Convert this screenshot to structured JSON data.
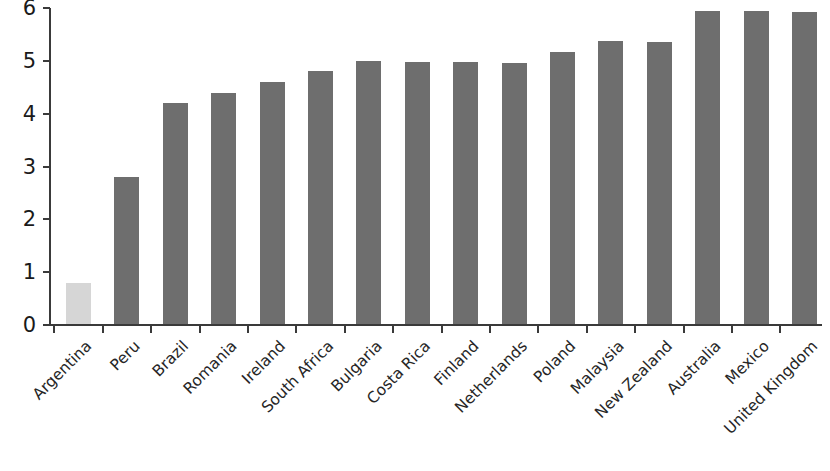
{
  "chart_data": {
    "type": "bar",
    "title": "",
    "subtitle": "",
    "xlabel": "",
    "ylabel": "",
    "categories": [
      "Argentina",
      "Peru",
      "Brazil",
      "Romania",
      "Ireland",
      "South Africa",
      "Bulgaria",
      "Costa Rica",
      "Finland",
      "Netherlands",
      "Poland",
      "Malaysia",
      "New Zealand",
      "Australia",
      "Mexico",
      "United Kingdom"
    ],
    "values": [
      0.8,
      2.8,
      4.2,
      4.4,
      4.6,
      4.8,
      5.0,
      4.98,
      4.97,
      4.96,
      5.17,
      5.37,
      5.35,
      5.95,
      5.95,
      5.93
    ],
    "bar_colors": [
      "#d6d6d6",
      "#6e6e6e",
      "#6e6e6e",
      "#6e6e6e",
      "#6e6e6e",
      "#6e6e6e",
      "#6e6e6e",
      "#6e6e6e",
      "#6e6e6e",
      "#6e6e6e",
      "#6e6e6e",
      "#6e6e6e",
      "#6e6e6e",
      "#6e6e6e",
      "#6e6e6e",
      "#6e6e6e"
    ],
    "highlight_category": "Argentina",
    "highlight_color": "#d6d6d6",
    "series_color": "#6e6e6e",
    "ylim": [
      0,
      6
    ],
    "ytick_values": [
      0,
      1,
      2,
      3,
      4,
      5,
      6
    ],
    "ytick_labels": [
      "0",
      "1",
      "2",
      "3",
      "4",
      "5",
      "6"
    ],
    "grid": false,
    "legend": null,
    "legend_position": "none",
    "xtick_label_rotation_deg": 45,
    "axis_color": "#3a3a3a"
  }
}
